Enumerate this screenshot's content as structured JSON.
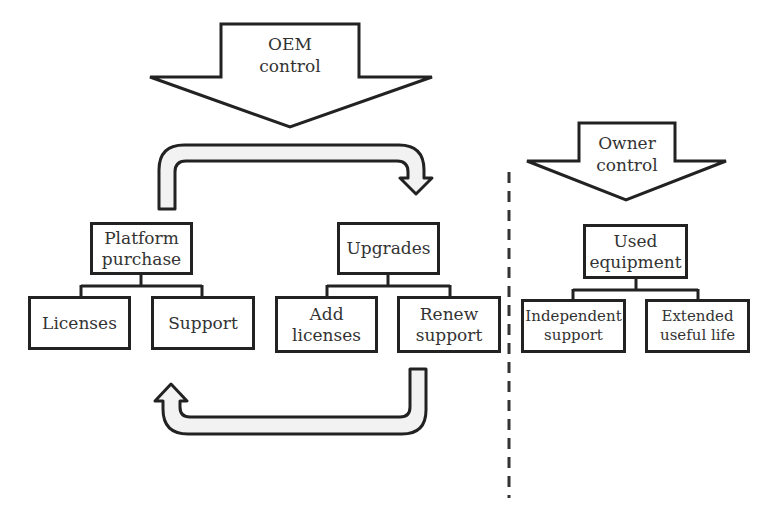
{
  "diagram": {
    "oem_arrow": {
      "label": "OEM\ncontrol"
    },
    "owner_arrow": {
      "label": "Owner\ncontrol"
    },
    "oem_side": {
      "platform_purchase": {
        "label": "Platform\npurchase",
        "children": [
          "Licenses",
          "Support"
        ]
      },
      "upgrades": {
        "label": "Upgrades",
        "children": [
          "Add\nlicenses",
          "Renew\nsupport"
        ]
      },
      "cycle_arrows": [
        {
          "from": "Platform purchase",
          "to": "Upgrades"
        },
        {
          "from": "Upgrades",
          "to": "Platform purchase"
        }
      ]
    },
    "owner_side": {
      "used_equipment": {
        "label": "Used\nequipment",
        "children": [
          "Independent\nsupport",
          "Extended\nuseful life"
        ]
      }
    },
    "colors": {
      "stroke": "#222222",
      "arrow_fill": "#f2f2f2",
      "text": "#333333",
      "background": "#ffffff"
    }
  }
}
